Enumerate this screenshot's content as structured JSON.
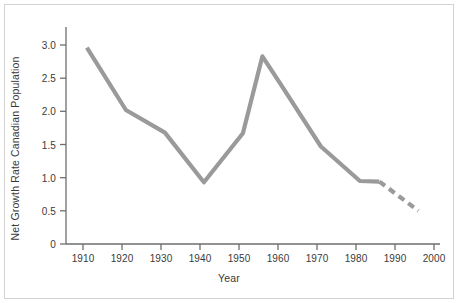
{
  "chart_data": {
    "type": "line",
    "title": "",
    "xlabel": "Year",
    "ylabel": "Net Growth Rate Canadian Population",
    "xlim": [
      1906,
      2002
    ],
    "ylim": [
      0,
      3.25
    ],
    "grid": false,
    "legend": "none",
    "line_color": "#9a9a9a",
    "axis_color": "#6e6e6e",
    "text_color": "#3a3a3a",
    "xticks": [
      1910,
      1920,
      1930,
      1940,
      1950,
      1960,
      1970,
      1980,
      1990,
      2000
    ],
    "xtick_labels": [
      "1910",
      "1920",
      "1930",
      "1940",
      "1950",
      "1960",
      "1970",
      "1980",
      "1990",
      "2000"
    ],
    "yticks": [
      0,
      0.5,
      1.0,
      1.5,
      2.0,
      2.5,
      3.0
    ],
    "ytick_labels": [
      "0",
      "0.5",
      "1.0",
      "1.5",
      "2.0",
      "2.5",
      "3.0"
    ],
    "series": [
      {
        "name": "observed",
        "style": "solid",
        "x": [
          1911,
          1921,
          1931,
          1941,
          1951,
          1956,
          1961,
          1971,
          1981,
          1986
        ],
        "values": [
          2.96,
          2.02,
          1.68,
          0.93,
          1.67,
          2.83,
          2.38,
          1.47,
          0.95,
          0.94
        ]
      },
      {
        "name": "projected",
        "style": "dashed",
        "x": [
          1986,
          1996
        ],
        "values": [
          0.94,
          0.5
        ]
      }
    ]
  },
  "figure": {
    "axis_label_x": "Year",
    "axis_label_y": "Net Growth Rate Canadian Population"
  }
}
